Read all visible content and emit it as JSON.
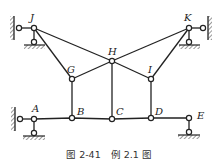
{
  "figure": {
    "caption": "图 2-41　例 2.1 图",
    "nodes": {
      "J": {
        "label": "J",
        "x": 34,
        "y": 28
      },
      "K": {
        "label": "K",
        "x": 189,
        "y": 28
      },
      "G": {
        "label": "G",
        "x": 72,
        "y": 79
      },
      "H": {
        "label": "H",
        "x": 112,
        "y": 61
      },
      "I": {
        "label": "I",
        "x": 151,
        "y": 79
      },
      "A": {
        "label": "A",
        "x": 34,
        "y": 119
      },
      "B": {
        "label": "B",
        "x": 72,
        "y": 118
      },
      "C": {
        "label": "C",
        "x": 112,
        "y": 119
      },
      "D": {
        "label": "D",
        "x": 151,
        "y": 118
      },
      "E": {
        "label": "E",
        "x": 189,
        "y": 118
      }
    },
    "members": [
      [
        "J",
        "H"
      ],
      [
        "J",
        "G"
      ],
      [
        "G",
        "H"
      ],
      [
        "K",
        "H"
      ],
      [
        "K",
        "I"
      ],
      [
        "I",
        "H"
      ],
      [
        "G",
        "B"
      ],
      [
        "H",
        "C"
      ],
      [
        "I",
        "D"
      ],
      [
        "A",
        "E"
      ]
    ],
    "supports": [
      {
        "node": "J",
        "type": "wall-link-left"
      },
      {
        "node": "J",
        "type": "ground-link-below"
      },
      {
        "node": "K",
        "type": "wall-link-right"
      },
      {
        "node": "K",
        "type": "ground-link-below"
      },
      {
        "node": "A",
        "type": "wall-link-left"
      },
      {
        "node": "A",
        "type": "ground-link-below"
      },
      {
        "node": "E",
        "type": "ground-link-below"
      }
    ],
    "colors": {
      "line": "#222222",
      "background": "#ffffff"
    }
  }
}
